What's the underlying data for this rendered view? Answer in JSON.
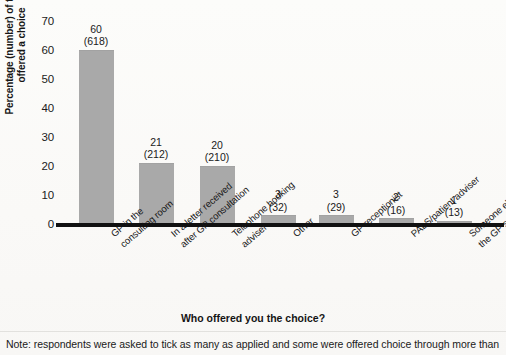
{
  "chart_data": {
    "type": "bar",
    "title": "",
    "xlabel": "Who offered you the choice?",
    "ylabel_line1": "Percentage (number) of those",
    "ylabel_line2": "offered a choice",
    "ylim": [
      0,
      70
    ],
    "ytick_labels": [
      "0",
      "10",
      "20",
      "30",
      "40",
      "50",
      "60",
      "70"
    ],
    "ytick_values": [
      0,
      10,
      20,
      30,
      40,
      50,
      60,
      70
    ],
    "grid": false,
    "legend": "none",
    "bar_color": "#a9a9a9",
    "categories": [
      "GP in the consulting room",
      "In a letter received after GP consultation",
      "Telephone booking adviser",
      "Other",
      "GP receptionist",
      "PALS/patient adviser",
      "Someone else in the GP surgery"
    ],
    "category_lines": [
      [
        "GP in the",
        "consulting room"
      ],
      [
        "In a letter received",
        "after GP consultation"
      ],
      [
        "Telephone booking",
        "adviser"
      ],
      [
        "Other"
      ],
      [
        "GP receptionist"
      ],
      [
        "PALS/patient adviser"
      ],
      [
        "Someone else in",
        "the GP surgery"
      ]
    ],
    "values": [
      60,
      21,
      20,
      3,
      3,
      2,
      1
    ],
    "counts": [
      618,
      212,
      210,
      32,
      29,
      16,
      13
    ],
    "value_labels": [
      "60",
      "21",
      "20",
      "3",
      "3",
      "2",
      "1"
    ],
    "count_labels": [
      "(618)",
      "(212)",
      "(210)",
      "(32)",
      "(29)",
      "(16)",
      "(13)"
    ]
  },
  "note": {
    "text": "Note: respondents were asked to tick as many as applied and some were offered choice through more than"
  }
}
